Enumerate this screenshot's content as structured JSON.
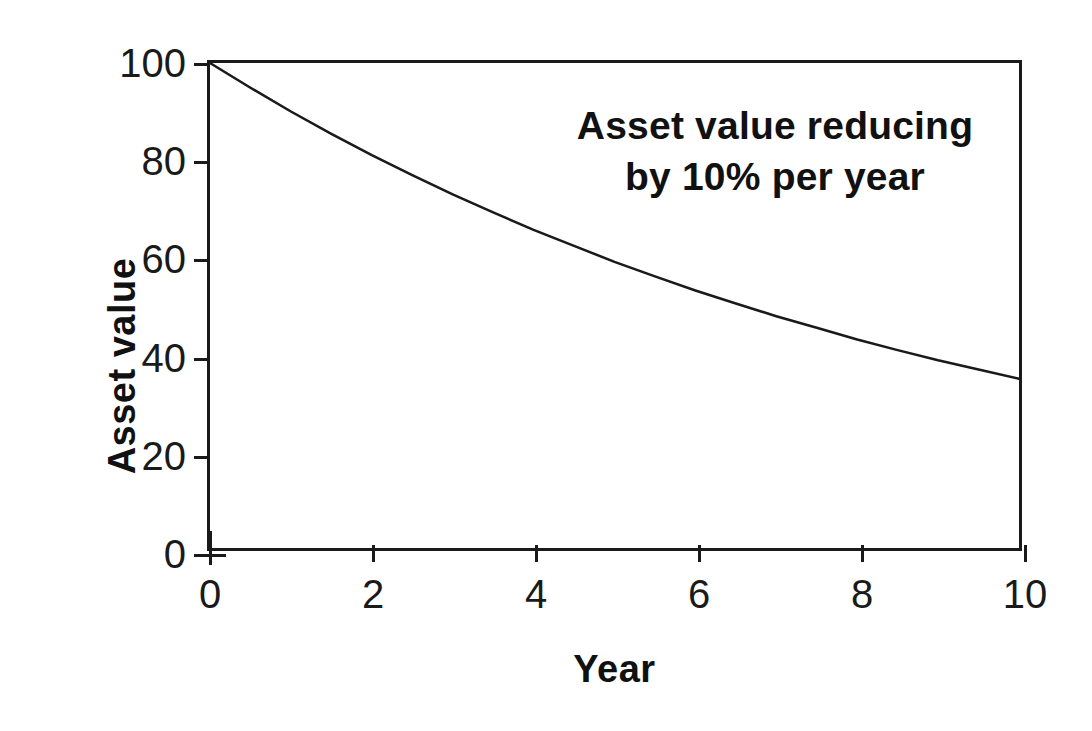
{
  "chart_data": {
    "type": "line",
    "title": "",
    "subtitle": "",
    "xlabel": "Year",
    "ylabel": "Asset value",
    "xlim": [
      0,
      10
    ],
    "ylim": [
      0,
      100
    ],
    "xticks": [
      "0",
      "2",
      "4",
      "6",
      "8",
      "10"
    ],
    "xtick_values": [
      0,
      2,
      4,
      6,
      8,
      10
    ],
    "yticks": [
      "0",
      "20",
      "40",
      "60",
      "80",
      "100"
    ],
    "ytick_values": [
      0,
      20,
      40,
      60,
      80,
      100
    ],
    "grid": false,
    "legend": "none",
    "annotations": [
      {
        "id": "decay-note",
        "lines": [
          "Asset value reducing",
          "by 10% per year"
        ],
        "position": "upper-right"
      }
    ],
    "series": [
      {
        "name": "Asset value",
        "formula": "100 * 0.9^t",
        "color": "#1a1a1a",
        "line_width": 2,
        "x": [
          0,
          0.5,
          1,
          1.5,
          2,
          2.5,
          3,
          3.5,
          4,
          4.5,
          5,
          5.5,
          6,
          6.5,
          7,
          7.5,
          8,
          8.5,
          9,
          9.5,
          10
        ],
        "values": [
          100,
          94.9,
          90,
          85.4,
          81,
          76.9,
          72.9,
          69.2,
          65.6,
          62.3,
          59,
          56,
          53.1,
          50.4,
          47.8,
          45.4,
          43,
          40.8,
          38.7,
          36.8,
          34.9
        ]
      }
    ],
    "key_points": [
      {
        "year": 0,
        "value": 100
      },
      {
        "year": 2,
        "value": 81
      },
      {
        "year": 4,
        "value": 65.6
      },
      {
        "year": 6,
        "value": 53.1
      },
      {
        "year": 8,
        "value": 43
      },
      {
        "year": 10,
        "value": 34.9
      }
    ]
  },
  "axes": {
    "y_title": "Asset value",
    "x_title": "Year"
  },
  "annotation": {
    "line1": "Asset value reducing",
    "line2": "by 10% per year"
  },
  "colors": {
    "ink": "#1a1a1a",
    "background": "#ffffff",
    "curve": "#1a1a1a"
  }
}
